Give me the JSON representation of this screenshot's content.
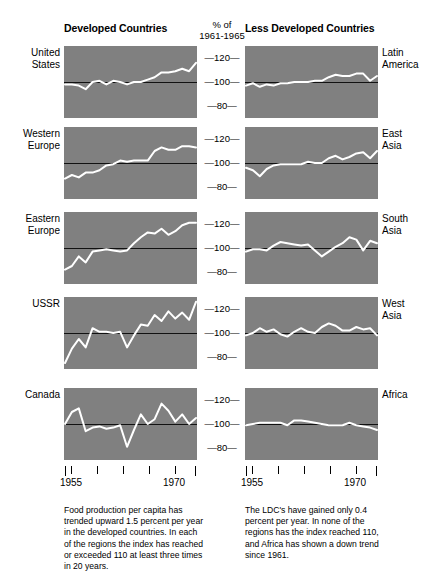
{
  "headers": {
    "left": "Developed Countries",
    "right": "Less Developed Countries"
  },
  "axis": {
    "title_line1": "% of",
    "title_line2": "1961-1965",
    "ticks": [
      "120",
      "100",
      "80"
    ],
    "dash": "—"
  },
  "xaxis": {
    "labels": [
      "1955",
      "1970"
    ],
    "left_label_positions": [
      7,
      110
    ],
    "right_label_positions": [
      7,
      110
    ]
  },
  "captions": {
    "left": "Food production per capita has trended upward 1.5 percent per year in the developed countries. In each of the regions the index has reached or exceeded 110 at least three times in 20 years.",
    "right": "The LDC's have gained only 0.4 percent per year. In none of the regions has the index reached 110, and Africa has shown a down trend since 1961."
  },
  "colors": {
    "panel_background": "#808080",
    "data_line": "#ffffff",
    "baseline": "#111111",
    "page_background": "#ffffff",
    "text": "#000000"
  },
  "rows": [
    {
      "left_label": "United\nStates",
      "right_label": "Latin\nAmerica"
    },
    {
      "left_label": "Western\nEurope",
      "right_label": "East\nAsia"
    },
    {
      "left_label": "Eastern\nEurope",
      "right_label": "South\nAsia"
    },
    {
      "left_label": "USSR",
      "right_label": "West\nAsia"
    },
    {
      "left_label": "Canada",
      "right_label": "Africa"
    }
  ],
  "chart_data": {
    "type": "line",
    "subtitle": "Index, % of 1961-1965 average",
    "xlabel": "Year",
    "ylabel": "% of 1961-1965",
    "ylim": [
      70,
      130
    ],
    "xlim": [
      1954,
      1973
    ],
    "grid": false,
    "legend": "none",
    "baseline_value": 100,
    "yticks": [
      120,
      100,
      80
    ],
    "xticks": [
      1955,
      1960,
      1965,
      1970
    ],
    "x": [
      1954,
      1955,
      1956,
      1957,
      1958,
      1959,
      1960,
      1961,
      1962,
      1963,
      1964,
      1965,
      1966,
      1967,
      1968,
      1969,
      1970,
      1971,
      1972,
      1973
    ],
    "panels": [
      {
        "group": "Developed Countries",
        "name": "United States",
        "values": [
          98,
          98,
          97,
          94,
          100,
          101,
          98,
          101,
          100,
          98,
          100,
          100,
          102,
          104,
          108,
          108,
          109,
          111,
          109,
          116
        ]
      },
      {
        "group": "Developed Countries",
        "name": "Western Europe",
        "values": [
          87,
          90,
          88,
          92,
          92,
          94,
          98,
          99,
          102,
          101,
          102,
          102,
          102,
          110,
          113,
          111,
          111,
          114,
          114,
          113
        ]
      },
      {
        "group": "Developed Countries",
        "name": "Eastern Europe",
        "values": [
          82,
          85,
          93,
          88,
          97,
          98,
          99,
          98,
          97,
          98,
          104,
          109,
          113,
          112,
          116,
          111,
          114,
          119,
          121,
          121
        ]
      },
      {
        "group": "Developed Countries",
        "name": "USSR",
        "values": [
          75,
          87,
          95,
          88,
          104,
          101,
          101,
          100,
          101,
          88,
          98,
          107,
          106,
          115,
          110,
          118,
          112,
          117,
          111,
          126
        ]
      },
      {
        "group": "Developed Countries",
        "name": "Canada",
        "values": [
          100,
          110,
          113,
          94,
          97,
          98,
          96,
          97,
          99,
          81,
          95,
          108,
          100,
          104,
          117,
          111,
          102,
          108,
          100,
          105
        ]
      },
      {
        "group": "Less Developed Countries",
        "name": "Latin America",
        "values": [
          97,
          99,
          96,
          98,
          97,
          99,
          99,
          100,
          100,
          100,
          101,
          101,
          104,
          106,
          105,
          105,
          107,
          107,
          101,
          105
        ]
      },
      {
        "group": "Less Developed Countries",
        "name": "East Asia",
        "values": [
          96,
          94,
          89,
          95,
          98,
          99,
          99,
          99,
          99,
          101,
          100,
          100,
          104,
          106,
          103,
          105,
          108,
          109,
          104,
          110
        ]
      },
      {
        "group": "Less Developed Countries",
        "name": "South Asia",
        "values": [
          97,
          99,
          99,
          98,
          102,
          105,
          104,
          103,
          102,
          103,
          98,
          93,
          97,
          101,
          104,
          109,
          107,
          98,
          106,
          104
        ]
      },
      {
        "group": "Less Developed Countries",
        "name": "West Asia",
        "values": [
          98,
          100,
          104,
          101,
          103,
          99,
          97,
          101,
          104,
          101,
          100,
          105,
          108,
          106,
          102,
          102,
          105,
          103,
          104,
          98
        ]
      },
      {
        "group": "Less Developed Countries",
        "name": "Africa",
        "values": [
          99,
          100,
          101,
          101,
          101,
          101,
          99,
          103,
          103,
          102,
          101,
          100,
          99,
          99,
          99,
          101,
          99,
          98,
          97,
          95
        ]
      }
    ]
  }
}
